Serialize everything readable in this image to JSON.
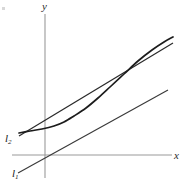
{
  "figure": {
    "background_color": "#ffffff",
    "axis_color": "#9a9a9a",
    "curve_color": "#1c1c1c",
    "line_color": "#3a3a3a",
    "labels": {
      "y_axis": "y",
      "x_axis": "x",
      "line_1_base": "l",
      "line_1_sub": "1",
      "line_2_base": "l",
      "line_2_sub": "2"
    }
  },
  "chart_data": {
    "type": "line",
    "title": "",
    "xlabel": "x",
    "ylabel": "y",
    "grid": false,
    "legend_position": "none",
    "axes": {
      "origin_px": [
        45,
        155
      ],
      "x_axis_extent_px": [
        12,
        172
      ],
      "y_axis_extent_px": [
        14,
        178
      ],
      "x_axis_y_px": 155,
      "y_axis_x_px": 45
    },
    "series": [
      {
        "name": "curve",
        "kind": "curve",
        "annotation": "",
        "points_px": [
          [
            19,
            133
          ],
          [
            30,
            131
          ],
          [
            42,
            129
          ],
          [
            54,
            126
          ],
          [
            64,
            122
          ],
          [
            74,
            116
          ],
          [
            86,
            108
          ],
          [
            98,
            98
          ],
          [
            110,
            87
          ],
          [
            124,
            74
          ],
          [
            138,
            61
          ],
          [
            152,
            50
          ],
          [
            164,
            42
          ],
          [
            173,
            37
          ]
        ]
      },
      {
        "name": "l2",
        "kind": "line",
        "annotation": "l2",
        "points_px": [
          [
            19,
            136
          ],
          [
            173,
            43
          ]
        ]
      },
      {
        "name": "l1",
        "kind": "line",
        "annotation": "l1",
        "points_px": [
          [
            18,
            173
          ],
          [
            168,
            90
          ]
        ]
      }
    ]
  }
}
